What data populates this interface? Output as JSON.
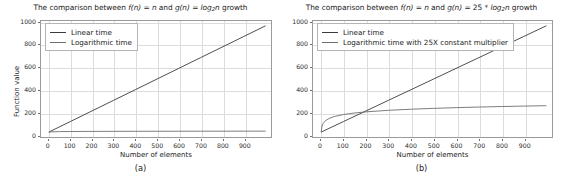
{
  "figure": {
    "panels": [
      {
        "id": "a",
        "caption": "(a)",
        "title_parts": {
          "pre": "The comparison between ",
          "fn": "f(n)",
          "mid1": " = ",
          "n1": "n",
          "mid2": " and ",
          "gn": "g(n)",
          "mid3": " = ",
          "log": "log",
          "logsub": "2",
          "logvar": "n",
          "post": " growth"
        },
        "title_plain": "The comparison between f(n) = n and g(n) = log2n growth",
        "legend": [
          {
            "label": "Linear time",
            "color": "#3b3b3b"
          },
          {
            "label": "Logarithmic time",
            "color": "#6e6e6e"
          }
        ],
        "chart_data": {
          "type": "line",
          "title": "The comparison between f(n) = n and g(n) = log2n growth",
          "xlabel": "Number of elements",
          "ylabel": "Function value",
          "xlim": [
            -35,
            1025
          ],
          "ylim": [
            -45,
            1045
          ],
          "xticks": [
            0,
            100,
            200,
            300,
            400,
            500,
            600,
            700,
            800,
            900
          ],
          "yticks": [
            0,
            200,
            400,
            600,
            800,
            1000
          ],
          "grid": true,
          "legend_position": "upper left",
          "series": [
            {
              "name": "Linear time",
              "color": "#3b3b3b",
              "x": [
                1,
                100,
                200,
                300,
                400,
                500,
                600,
                700,
                800,
                900,
                1000
              ],
              "values": [
                1,
                100,
                200,
                300,
                400,
                500,
                600,
                700,
                800,
                900,
                1000
              ]
            },
            {
              "name": "Logarithmic time",
              "color": "#6e6e6e",
              "x": [
                1,
                10,
                50,
                100,
                200,
                300,
                400,
                500,
                600,
                700,
                800,
                900,
                1000
              ],
              "values": [
                0,
                3.32,
                5.64,
                6.64,
                7.64,
                8.23,
                8.64,
                8.97,
                9.23,
                9.45,
                9.64,
                9.81,
                9.97
              ]
            }
          ]
        }
      },
      {
        "id": "b",
        "caption": "(b)",
        "title_parts": {
          "pre": "The comparison between ",
          "fn": "f(n)",
          "mid1": " = ",
          "n1": "n",
          "mid2": " and ",
          "gn": "g(n)",
          "mid3": " = 25 * ",
          "log": "log",
          "logsub": "2",
          "logvar": "n",
          "post": " growth"
        },
        "title_plain": "The comparison between f(n) = n and g(n) = 25 * log2n growth",
        "legend": [
          {
            "label": "Linear time",
            "color": "#3b3b3b"
          },
          {
            "label": "Logarithmic time with 25X constant multiplier",
            "color": "#6e6e6e"
          }
        ],
        "chart_data": {
          "type": "line",
          "title": "The comparison between f(n) = n and g(n) = 25 * log2n growth",
          "xlabel": "Number of elements",
          "ylabel": "",
          "xlim": [
            -35,
            1025
          ],
          "ylim": [
            -45,
            1045
          ],
          "xticks": [
            0,
            100,
            200,
            300,
            400,
            500,
            600,
            700,
            800,
            900
          ],
          "yticks": [
            0,
            200,
            400,
            600,
            800,
            1000
          ],
          "grid": true,
          "legend_position": "upper left",
          "series": [
            {
              "name": "Linear time",
              "color": "#3b3b3b",
              "x": [
                1,
                100,
                200,
                300,
                400,
                500,
                600,
                700,
                800,
                900,
                1000
              ],
              "values": [
                1,
                100,
                200,
                300,
                400,
                500,
                600,
                700,
                800,
                900,
                1000
              ]
            },
            {
              "name": "Logarithmic time with 25X constant multiplier",
              "color": "#6e6e6e",
              "x": [
                1,
                5,
                10,
                20,
                40,
                60,
                100,
                150,
                200,
                300,
                400,
                500,
                600,
                700,
                800,
                900,
                1000
              ],
              "values": [
                0,
                58.0,
                83.0,
                108.1,
                133.0,
                147.6,
                166.1,
                180.8,
                191.1,
                205.8,
                216.1,
                224.1,
                230.8,
                236.4,
                241.2,
                245.4,
                249.1
              ]
            }
          ]
        }
      }
    ]
  }
}
